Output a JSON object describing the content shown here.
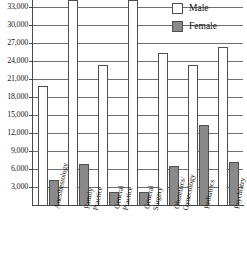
{
  "chart_data": {
    "type": "bar",
    "title": "",
    "subtitle": "",
    "xlabel": "",
    "ylabel": "",
    "grid": true,
    "legend_position": "top-right",
    "ylim": [
      0,
      34200
    ],
    "yticks": [
      3000,
      6000,
      9000,
      12000,
      15000,
      18000,
      21000,
      24000,
      27000,
      30000,
      33000
    ],
    "ytick_labels": [
      "3,000",
      "6,000",
      "9,000",
      "12,000",
      "15,000",
      "18,000",
      "21,000",
      "24,000",
      "27,000",
      "30,000",
      "33,000"
    ],
    "categories": [
      "Anesthesiology",
      "Family Practice",
      "General Practice",
      "General Surgery",
      "Obstetrics/ Gynecology",
      "Pediatrics",
      "Psychiatry"
    ],
    "category_lines": [
      [
        "Anesthesiology"
      ],
      [
        "Family",
        "Practice"
      ],
      [
        "General",
        "Practice"
      ],
      [
        "General",
        "Surgery"
      ],
      [
        "Obstetrics/",
        "Gynecology"
      ],
      [
        "Pediatrics"
      ],
      [
        "Psychiatry"
      ]
    ],
    "series": [
      {
        "name": "Male",
        "color": "#ffffff",
        "values": [
          19800,
          34200,
          23400,
          34200,
          25300,
          23300,
          26300
        ],
        "clipped": [
          false,
          true,
          false,
          true,
          false,
          false,
          false
        ]
      },
      {
        "name": "Female",
        "color": "#8a8a8a",
        "values": [
          4150,
          6900,
          2250,
          2250,
          6450,
          13300,
          7200
        ],
        "clipped": [
          false,
          false,
          false,
          false,
          false,
          false,
          false
        ]
      }
    ]
  },
  "legend": {
    "items": [
      {
        "label": "Male",
        "swatch": "male"
      },
      {
        "label": "Female",
        "swatch": "female"
      }
    ]
  },
  "colors": {
    "female_fill": "#8a8a8a",
    "male_fill": "#ffffff",
    "bar_outline": "#4f4f4f",
    "gridline": "#6f6f6f",
    "axis": "#4a4a4a",
    "text": "#141414"
  }
}
